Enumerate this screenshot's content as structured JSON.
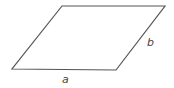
{
  "diagram": {
    "shape": "parallelogram",
    "vertices": {
      "top_left": [
        62,
        6
      ],
      "top_right": [
        165,
        6
      ],
      "bottom_right": [
        116,
        70
      ],
      "bottom_left": [
        12,
        69
      ]
    },
    "stroke_color": "#555555",
    "labels": {
      "a": "a",
      "b": "b"
    },
    "label_positions": {
      "a": [
        62,
        83
      ],
      "b": [
        147,
        46
      ]
    }
  }
}
